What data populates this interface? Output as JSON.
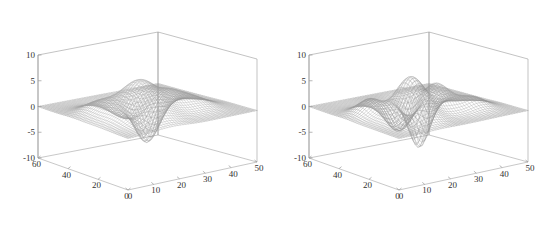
{
  "figure": {
    "background_color": "#ffffff",
    "axis_color": "#9a9a9a",
    "mesh_color": "#707070",
    "tick_text_color": "#333333",
    "panel_count": 2
  },
  "chart_data": [
    {
      "type": "surface",
      "name": "left-mesh-plot",
      "title": "",
      "subtitle": "",
      "xlabel": "",
      "ylabel": "",
      "zlabel": "",
      "grid": false,
      "legend": "none",
      "render": "wireframe-mesh",
      "xlim": [
        0,
        50
      ],
      "ylim": [
        0,
        60
      ],
      "zlim": [
        -10,
        10
      ],
      "xticks": [
        0,
        10,
        20,
        30,
        40,
        50
      ],
      "yticks": [
        0,
        20,
        40,
        60
      ],
      "zticks": [
        -10,
        -5,
        0,
        5,
        10
      ],
      "xticklabels": [
        "0",
        "10",
        "20",
        "30",
        "40",
        "50"
      ],
      "yticklabels": [
        "0",
        "20",
        "40",
        "60"
      ],
      "zticklabels": [
        "-10",
        "-5",
        "0",
        "5",
        "10"
      ],
      "grid_nx": 49,
      "grid_ny": 49,
      "view_azimuth": -37.5,
      "view_elevation": 30,
      "surface_kind": "peaks",
      "annotations": [],
      "peaks": [
        {
          "cx": 0.34,
          "cy": 0.35,
          "amp": 7.2,
          "sx": 0.125,
          "sy": 0.15
        },
        {
          "cx": 0.6,
          "cy": 0.42,
          "amp": 3.4,
          "sx": 0.115,
          "sy": 0.125
        },
        {
          "cx": 0.47,
          "cy": 0.64,
          "amp": -3.3,
          "sx": 0.11,
          "sy": 0.105
        },
        {
          "cx": 0.7,
          "cy": 0.74,
          "amp": -8.5,
          "sx": 0.085,
          "sy": 0.08
        },
        {
          "cx": 0.22,
          "cy": 0.62,
          "amp": 2.0,
          "sx": 0.1,
          "sy": 0.1
        },
        {
          "cx": 0.76,
          "cy": 0.3,
          "amp": 1.5,
          "sx": 0.1,
          "sy": 0.11
        }
      ]
    },
    {
      "type": "surface",
      "name": "right-mesh-plot",
      "title": "",
      "subtitle": "",
      "xlabel": "",
      "ylabel": "",
      "zlabel": "",
      "grid": false,
      "legend": "none",
      "render": "wireframe-mesh",
      "xlim": [
        0,
        50
      ],
      "ylim": [
        0,
        60
      ],
      "zlim": [
        -10,
        10
      ],
      "xticks": [
        0,
        10,
        20,
        30,
        40,
        50
      ],
      "yticks": [
        0,
        20,
        40,
        60
      ],
      "zticks": [
        -10,
        -5,
        0,
        5,
        10
      ],
      "xticklabels": [
        "0",
        "10",
        "20",
        "30",
        "40",
        "50"
      ],
      "yticklabels": [
        "0",
        "20",
        "40",
        "60"
      ],
      "zticklabels": [
        "-10",
        "-5",
        "0",
        "5",
        "10"
      ],
      "grid_nx": 49,
      "grid_ny": 49,
      "view_azimuth": -37.5,
      "view_elevation": 30,
      "surface_kind": "peaks-sharp",
      "annotations": [],
      "peaks": [
        {
          "cx": 0.33,
          "cy": 0.33,
          "amp": 8.2,
          "sx": 0.095,
          "sy": 0.115
        },
        {
          "cx": 0.58,
          "cy": 0.4,
          "amp": 5.2,
          "sx": 0.09,
          "sy": 0.1
        },
        {
          "cx": 0.44,
          "cy": 0.6,
          "amp": -5.0,
          "sx": 0.09,
          "sy": 0.085
        },
        {
          "cx": 0.7,
          "cy": 0.73,
          "amp": -9.6,
          "sx": 0.072,
          "sy": 0.068
        },
        {
          "cx": 0.21,
          "cy": 0.6,
          "amp": 3.0,
          "sx": 0.085,
          "sy": 0.085
        },
        {
          "cx": 0.78,
          "cy": 0.28,
          "amp": 2.2,
          "sx": 0.085,
          "sy": 0.09
        }
      ]
    }
  ]
}
